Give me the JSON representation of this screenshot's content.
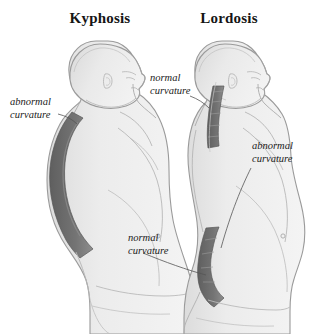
{
  "figure": {
    "type": "anatomical-comparison-diagram",
    "background_color": "#ffffff",
    "width": 313,
    "height": 334
  },
  "titles": {
    "left": "Kyphosis",
    "right": "Lordosis"
  },
  "annotations": {
    "abnormal_left_line1": "abnormal",
    "abnormal_left_line2": "curvature",
    "normal_cervical_line1": "normal",
    "normal_cervical_line2": "curvature",
    "abnormal_right_line1": "abnormal",
    "abnormal_right_line2": "curvature",
    "normal_lumbar_line1": "normal",
    "normal_lumbar_line2": "curvature"
  },
  "colors": {
    "body_fill": "#e9e9e9",
    "body_fill_light": "#f1f1f1",
    "body_outline": "#9a9a9a",
    "detail_line": "#b4b4b4",
    "curvature_band": "#6e6e6e",
    "curvature_band_light": "#8c8c8c",
    "leader_line": "#555555",
    "text": "#151515"
  },
  "figures": [
    {
      "name": "kyphosis-figure",
      "side": "left",
      "facing": "right",
      "highlight_region": "thoracic",
      "highlight_description": "exaggerated outward rounding of the upper back",
      "label": "abnormal curvature"
    },
    {
      "name": "lordosis-figure",
      "side": "right",
      "facing": "right",
      "highlight_regions": [
        "cervical",
        "lumbar"
      ],
      "cervical_label": "normal curvature",
      "lumbar_label_normal": "normal curvature",
      "lumbar_label_abnormal": "abnormal curvature",
      "highlight_description": "exaggerated inward curve of the lower back"
    }
  ]
}
